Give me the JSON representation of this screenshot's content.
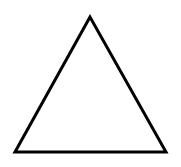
{
  "diagram": {
    "shape": "triangle",
    "fill": "#ffffff",
    "stroke": "#000000",
    "stroke_width": 3,
    "vertices": {
      "apex": [
        90,
        17
      ],
      "bottom_left": [
        15,
        152
      ],
      "bottom_right": [
        166,
        152
      ]
    }
  }
}
